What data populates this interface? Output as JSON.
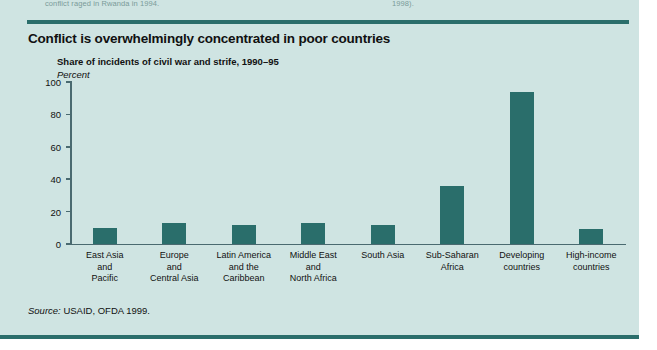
{
  "page": {
    "background_color": "#cfe4e2",
    "rule_color": "#2b6e6b",
    "bar_color": "#2a6e6b",
    "axis_color": "#4a6a70"
  },
  "header_fragments": {
    "left": "conflict raged in Rwanda in 1994.",
    "right": "1998)."
  },
  "figure": {
    "title": "Conflict is overwhelmingly concentrated in poor countries",
    "subtitle": "Share of incidents of civil war and strife, 1990–95",
    "unit_label": "Percent",
    "source_prefix": "Source:",
    "source_text": " USAID, OFDA 1999."
  },
  "chart_data": {
    "type": "bar",
    "title": "Conflict is overwhelmingly concentrated in poor countries",
    "subtitle": "Share of incidents of civil war and strife, 1990–95",
    "xlabel": "",
    "ylabel": "Percent",
    "ylim": [
      0,
      100
    ],
    "yticks": [
      0,
      20,
      40,
      60,
      80,
      100
    ],
    "grid": false,
    "legend": null,
    "categories": [
      "East Asia\nand\nPacific",
      "Europe\nand\nCentral Asia",
      "Latin America\nand the\nCaribbean",
      "Middle East\nand\nNorth Africa",
      "South Asia",
      "Sub-Saharan\nAfrica",
      "Developing\ncountries",
      "High-income\ncountries"
    ],
    "category_lines": [
      [
        "East Asia",
        "and",
        "Pacific"
      ],
      [
        "Europe",
        "and",
        "Central Asia"
      ],
      [
        "Latin America",
        "and the",
        "Caribbean"
      ],
      [
        "Middle East",
        "and",
        "North Africa"
      ],
      [
        "South Asia"
      ],
      [
        "Sub-Saharan",
        "Africa"
      ],
      [
        "Developing",
        "countries"
      ],
      [
        "High-income",
        "countries"
      ]
    ],
    "values": [
      10,
      13,
      12,
      13,
      12,
      36,
      94,
      9
    ],
    "source": "Source: USAID, OFDA 1999."
  }
}
